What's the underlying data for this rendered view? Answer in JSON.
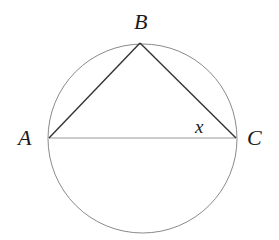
{
  "diagram": {
    "type": "inscribed-triangle-in-circle",
    "circle": {
      "cx": 142.5,
      "cy": 138.5,
      "r": 95
    },
    "points": [
      {
        "id": "A",
        "label": "A",
        "x": 49,
        "y": 138
      },
      {
        "id": "B",
        "label": "B",
        "x": 140,
        "y": 43
      },
      {
        "id": "C",
        "label": "C",
        "x": 236,
        "y": 138
      }
    ],
    "segments": [
      "AB",
      "BC",
      "AC"
    ],
    "angle_label": {
      "at": "C",
      "text": "x"
    },
    "colors": {
      "circle": "#888888",
      "triangle": "#333333",
      "diameter": "#999999",
      "text": "#1a1a1a"
    }
  }
}
